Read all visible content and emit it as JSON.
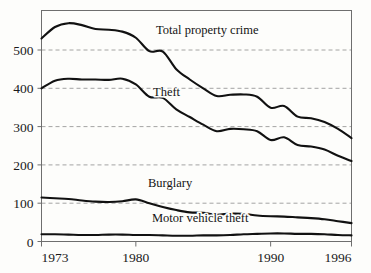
{
  "chart_data": {
    "type": "line",
    "title": "",
    "subtitle": "",
    "xlabel": "",
    "ylabel": "",
    "xlim": [
      1973,
      1996
    ],
    "ylim": [
      0,
      600
    ],
    "grid": true,
    "grid_axis": "y",
    "legend_position": "inline-annotations",
    "x_tick_labels": [
      "1973",
      "1980",
      "1990",
      "1996"
    ],
    "x_tick_values": [
      1973,
      1980,
      1990,
      1996
    ],
    "y_tick_labels": [
      "0",
      "100",
      "200",
      "300",
      "400",
      "500"
    ],
    "y_tick_values": [
      0,
      100,
      200,
      300,
      400,
      500
    ],
    "x": [
      1973,
      1974,
      1975,
      1976,
      1977,
      1978,
      1979,
      1980,
      1981,
      1982,
      1983,
      1984,
      1985,
      1986,
      1987,
      1988,
      1989,
      1990,
      1991,
      1992,
      1993,
      1994,
      1995,
      1996
    ],
    "series": [
      {
        "name": "Total property crime",
        "color": "#111111",
        "values": [
          530,
          560,
          570,
          565,
          555,
          553,
          548,
          532,
          497,
          496,
          450,
          423,
          400,
          380,
          383,
          384,
          378,
          349,
          354,
          326,
          322,
          312,
          294,
          270
        ]
      },
      {
        "name": "Theft",
        "color": "#111111",
        "values": [
          400,
          420,
          425,
          423,
          423,
          422,
          425,
          410,
          378,
          375,
          345,
          325,
          305,
          288,
          294,
          293,
          288,
          265,
          272,
          252,
          248,
          240,
          224,
          210
        ]
      },
      {
        "name": "Burglary",
        "color": "#111111",
        "values": [
          115,
          113,
          111,
          107,
          104,
          103,
          105,
          110,
          100,
          90,
          82,
          76,
          75,
          70,
          73,
          72,
          68,
          66,
          65,
          63,
          61,
          58,
          53,
          48
        ]
      },
      {
        "name": "Motor vehicle theft",
        "color": "#111111",
        "values": [
          19,
          19,
          18,
          17,
          17,
          18,
          18,
          17,
          17,
          16,
          15,
          15,
          16,
          16,
          17,
          19,
          20,
          21,
          21,
          20,
          20,
          19,
          17,
          16
        ]
      }
    ],
    "annotations": [
      {
        "label": "Total property crime",
        "x_px": 156,
        "y_px": 34
      },
      {
        "label": "Theft",
        "x_px": 153,
        "y_px": 96
      },
      {
        "label": "Burglary",
        "x_px": 148,
        "y_px": 187
      },
      {
        "label": "Motor vehicle theft",
        "x_px": 152,
        "y_px": 222
      }
    ]
  }
}
